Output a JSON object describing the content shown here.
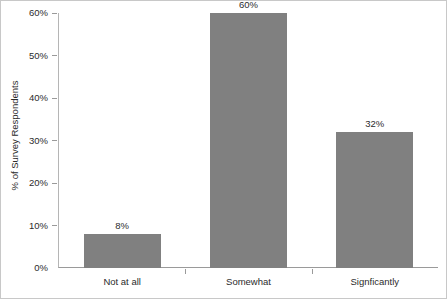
{
  "chart_data": {
    "type": "bar",
    "title": "",
    "subtitle": "",
    "categories": [
      "Not at all",
      "Somewhat",
      "Signficantly"
    ],
    "values": [
      8,
      60,
      32
    ],
    "data_labels": [
      "8%",
      "60%",
      "32%"
    ],
    "xlabel": "",
    "ylabel": "% of Survey Respondents",
    "ylim": [
      0,
      60
    ],
    "ytick_values": [
      0,
      10,
      20,
      30,
      40,
      50,
      60
    ],
    "ytick_labels": [
      "0%",
      "10%",
      "20%",
      "30%",
      "40%",
      "50%",
      "60%"
    ],
    "grid": false,
    "legend": null,
    "legend_position": "none",
    "colors": {
      "bar_fill": "#808080",
      "plot_background": "#ffffff",
      "frame_border": "#c8c8c8",
      "axis_line": "#9a9a9a",
      "text": "#2b2b2b"
    }
  }
}
